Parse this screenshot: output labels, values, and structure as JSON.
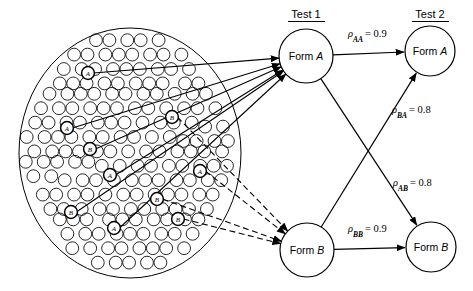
{
  "figure": {
    "kind": "path-diagram"
  },
  "headers": {
    "test1": "Test 1",
    "test2": "Test 2"
  },
  "nodes": [
    {
      "id": "t1a",
      "label": "Form A",
      "cx": 306,
      "cy": 56,
      "r": 27,
      "group": "test1"
    },
    {
      "id": "t1b",
      "label": "Form B",
      "cx": 307,
      "cy": 250,
      "r": 27,
      "group": "test1"
    },
    {
      "id": "t2a",
      "label": "Form A",
      "cx": 430,
      "cy": 51,
      "r": 25,
      "group": "test2"
    },
    {
      "id": "t2b",
      "label": "Form B",
      "cx": 431,
      "cy": 247,
      "r": 25,
      "group": "test2"
    }
  ],
  "edges": [
    {
      "id": "aa",
      "from": "t1a",
      "to": "t2a",
      "label": "ρ",
      "sub": "AA",
      "eq": "= 0.9",
      "lx": 348,
      "ly": 37
    },
    {
      "id": "ba",
      "from": "t1b",
      "to": "t2a",
      "label": "ρ",
      "sub": "BA",
      "eq": "= 0.8",
      "lx": 392,
      "ly": 113
    },
    {
      "id": "ab",
      "from": "t1a",
      "to": "t2b",
      "label": "ρ",
      "sub": "AB",
      "eq": "= 0.8",
      "lx": 393,
      "ly": 186
    },
    {
      "id": "bb",
      "from": "t1b",
      "to": "t2b",
      "label": "ρ",
      "sub": "BB",
      "eq": "= 0.9",
      "lx": 348,
      "ly": 232
    }
  ],
  "correlations": {
    "rho_AA": 0.9,
    "rho_BA": 0.8,
    "rho_AB": 0.8,
    "rho_BB": 0.9
  },
  "population": {
    "cx": 130,
    "cy": 153,
    "rx": 111,
    "ry": 125,
    "dot_radius": 6.4,
    "label_a": "A",
    "label_b": "B",
    "sampled_to_form_a": [
      {
        "label": "A",
        "x": 88,
        "y": 73
      },
      {
        "label": "A",
        "x": 67,
        "y": 128
      },
      {
        "label": "B",
        "x": 90,
        "y": 149
      },
      {
        "label": "A",
        "x": 110,
        "y": 175
      },
      {
        "label": "B",
        "x": 71,
        "y": 212
      },
      {
        "label": "A",
        "x": 114,
        "y": 228
      }
    ],
    "sampled_to_form_b": [
      {
        "label": "B",
        "x": 172,
        "y": 117
      },
      {
        "label": "A",
        "x": 200,
        "y": 171
      },
      {
        "label": "B",
        "x": 157,
        "y": 199
      },
      {
        "label": "B",
        "x": 178,
        "y": 219
      }
    ]
  }
}
